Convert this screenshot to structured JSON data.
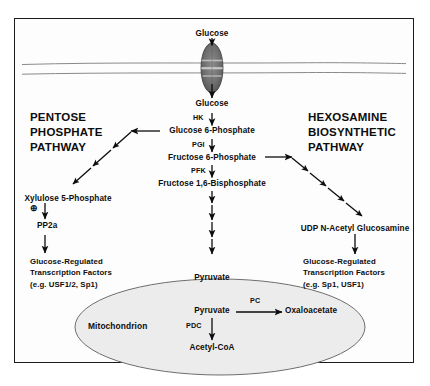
{
  "figure": {
    "background": "#ffffff",
    "border_color": "#1b1b1b",
    "ink": "#0d0d0d",
    "membrane_color": "#8a8a8a",
    "organelle_fill": "#ececec"
  },
  "headings": {
    "left": "PENTOSE\nPHOSPHATE\nPATHWAY",
    "left_lines": [
      "PENTOSE",
      "PHOSPHATE",
      "PATHWAY"
    ],
    "right_lines": [
      "HEXOSAMINE",
      "BIOSYNTHETIC",
      "PATHWAY"
    ]
  },
  "transporter": {
    "name": "glucose-transporter",
    "shape": "shaded-ellipse-in-membrane"
  },
  "metabolites": {
    "glucose_out": "Glucose",
    "glucose_in": "Glucose",
    "g6p": "Glucose 6-Phosphate",
    "f6p": "Fructose 6-Phosphate",
    "f16bp": "Fructose 1,6-Bisphosphate",
    "pyruvate_cyto": "Pyruvate",
    "pyruvate_mito": "Pyruvate",
    "oxaloacetate": "Oxaloacetate",
    "acetyl_coa": "Acetyl-CoA",
    "xylulose5p": "Xylulose 5-Phosphate",
    "pp2a": "PP2a",
    "udp_glcnac": "UDP N-Acetyl Glucosamine"
  },
  "enzymes": {
    "hk": "HK",
    "pgi": "PGI",
    "pfk": "PFK",
    "pc": "PC",
    "pdc": "PDC"
  },
  "transcription_factors": {
    "left_lines": [
      "Glucose-Regulated",
      "Transcription Factors",
      "(e.g. USF1/2, Sp1)"
    ],
    "right_lines": [
      "Glucose-Regulated",
      "Transcription Factors",
      "(e.g. Sp1, USF1)"
    ]
  },
  "organelle": {
    "mitochondrion": "Mitochondrion"
  },
  "symbols": {
    "activation": "⊕"
  }
}
